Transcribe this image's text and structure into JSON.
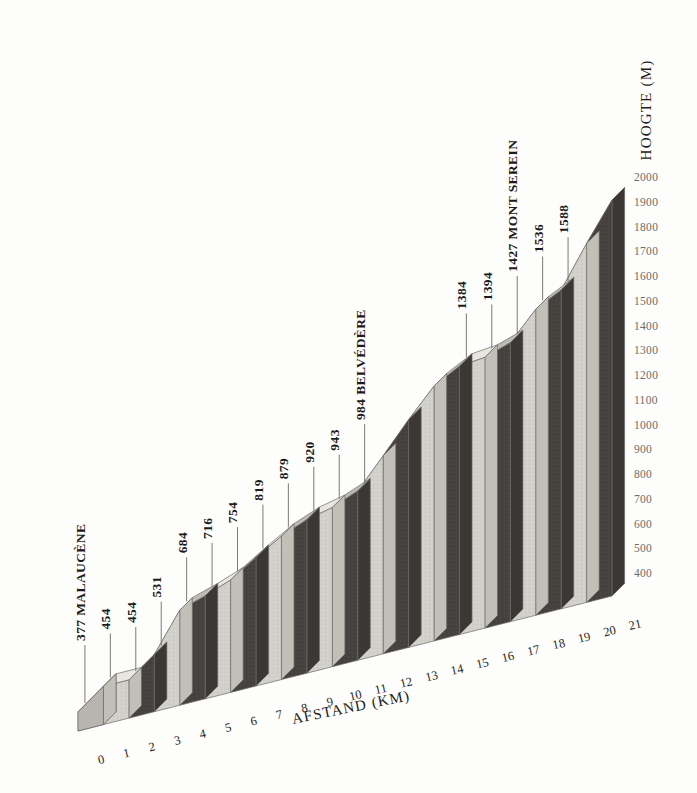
{
  "chart_data": {
    "type": "bar",
    "title": "",
    "subtitle": "",
    "xlabel": "AFSTAND (KM)",
    "ylabel": "HOOGTE (M)",
    "xlim": [
      0,
      21
    ],
    "ylim": [
      300,
      2000
    ],
    "grid": false,
    "legend": null,
    "style": "3d-isometric-elevation-profile",
    "x": [
      0,
      1,
      2,
      3,
      4,
      5,
      6,
      7,
      8,
      9,
      10,
      11,
      12,
      13,
      14,
      15,
      16,
      17,
      18,
      19,
      20,
      21
    ],
    "xtick_labels": [
      "0",
      "1",
      "2",
      "3",
      "4",
      "5",
      "6",
      "7",
      "8",
      "9",
      "10",
      "11",
      "12",
      "13",
      "14",
      "15",
      "16",
      "17",
      "18",
      "19",
      "20",
      "21"
    ],
    "ytick_labels": [
      "400",
      "500",
      "600",
      "700",
      "800",
      "900",
      "1000",
      "1100",
      "1200",
      "1300",
      "1400",
      "1500",
      "1600",
      "1700",
      "1800",
      "1900",
      "2000"
    ],
    "ytick_values": [
      400,
      500,
      600,
      700,
      800,
      900,
      1000,
      1100,
      1200,
      1300,
      1400,
      1500,
      1600,
      1700,
      1800,
      1900,
      2000
    ],
    "values": [
      377,
      454,
      454,
      531,
      684,
      716,
      754,
      819,
      879,
      920,
      943,
      984,
      1100,
      1220,
      1330,
      1384,
      1394,
      1427,
      1536,
      1588,
      1750,
      1900
    ],
    "annotations": [
      {
        "km": 0,
        "value": 377,
        "label": "377 MALAUCÈNE"
      },
      {
        "km": 1,
        "value": 454,
        "label": "454"
      },
      {
        "km": 2,
        "value": 454,
        "label": "454"
      },
      {
        "km": 3,
        "value": 531,
        "label": "531"
      },
      {
        "km": 4,
        "value": 684,
        "label": "684"
      },
      {
        "km": 5,
        "value": 716,
        "label": "716"
      },
      {
        "km": 6,
        "value": 754,
        "label": "754"
      },
      {
        "km": 7,
        "value": 819,
        "label": "819"
      },
      {
        "km": 8,
        "value": 879,
        "label": "879"
      },
      {
        "km": 9,
        "value": 920,
        "label": "920"
      },
      {
        "km": 10,
        "value": 943,
        "label": "943"
      },
      {
        "km": 11,
        "value": 984,
        "label": "984 BELVÉDÈRE"
      },
      {
        "km": 15,
        "value": 1384,
        "label": "1384"
      },
      {
        "km": 16,
        "value": 1394,
        "label": "1394"
      },
      {
        "km": 17,
        "value": 1427,
        "label": "1427 MONT SEREIN"
      },
      {
        "km": 18,
        "value": 1536,
        "label": "1536"
      },
      {
        "km": 19,
        "value": 1588,
        "label": "1588"
      }
    ],
    "colors": {
      "dark_face": "#46423f",
      "dark_side": "#3a3734",
      "light_face": "#d2d0ca",
      "light_top": "#e8e6e1",
      "mid_top": "#bdbab4",
      "base": "#b8b5b0",
      "outline": "#6d6b67",
      "text": "#1c1b1a",
      "tick": "#6e6c68",
      "background": "#fdfdfc"
    }
  },
  "axes": {
    "x_title": "AFSTAND (KM)",
    "y_title": "HOOGTE (M)"
  },
  "callouts": [
    {
      "text": "377 MALAUCÈNE"
    },
    {
      "text": "454"
    },
    {
      "text": "454"
    },
    {
      "text": "531"
    },
    {
      "text": "684"
    },
    {
      "text": "716"
    },
    {
      "text": "754"
    },
    {
      "text": "819"
    },
    {
      "text": "879"
    },
    {
      "text": "920"
    },
    {
      "text": "943"
    },
    {
      "text": "984 BELVÉDÈRE"
    },
    {
      "text": "1384"
    },
    {
      "text": "1394"
    },
    {
      "text": "1427 MONT SEREIN"
    },
    {
      "text": "1536"
    },
    {
      "text": "1588"
    }
  ]
}
